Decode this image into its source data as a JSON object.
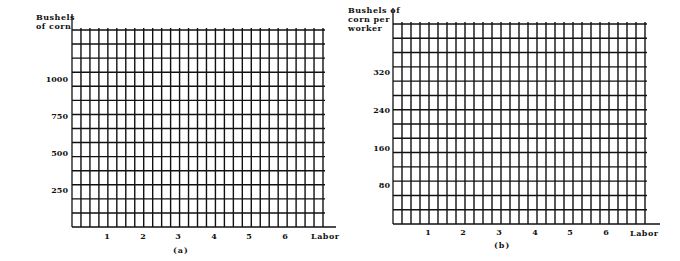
{
  "chart_data": [
    {
      "type": "line",
      "panel": "(a)",
      "title": "",
      "ylabel": "Bushels of corn",
      "xlabel": "Labor",
      "x_ticks": [
        "1",
        "2",
        "3",
        "4",
        "5",
        "6"
      ],
      "y_ticks": [
        "250",
        "500",
        "750",
        "1000"
      ],
      "ylim": [
        0,
        1350
      ],
      "xlim": [
        0,
        7
      ],
      "grid": true,
      "series": [],
      "caption": "(a)"
    },
    {
      "type": "line",
      "panel": "(b)",
      "title": "",
      "ylabel": "Bushels of corn per worker",
      "xlabel": "Labor",
      "x_ticks": [
        "1",
        "2",
        "3",
        "4",
        "5",
        "6"
      ],
      "y_ticks": [
        "80",
        "160",
        "240",
        "320"
      ],
      "ylim": [
        0,
        400
      ],
      "xlim": [
        0,
        7
      ],
      "grid": true,
      "series": [],
      "caption": "(b)"
    }
  ],
  "left": {
    "ylabel_line1": "Bushels",
    "ylabel_line2": "of corn",
    "xlabel": "Labor",
    "yticks": [
      "1000",
      "750",
      "500",
      "250"
    ],
    "xticks": [
      "1",
      "2",
      "3",
      "4",
      "5",
      "6"
    ],
    "caption": "(a)"
  },
  "right": {
    "ylabel_line1": "Bushels of",
    "ylabel_line2": "corn per",
    "ylabel_line3": "worker",
    "xlabel": "Labor",
    "yticks": [
      "320",
      "240",
      "160",
      "80"
    ],
    "xticks": [
      "1",
      "2",
      "3",
      "4",
      "5",
      "6"
    ],
    "caption": "(b)"
  }
}
